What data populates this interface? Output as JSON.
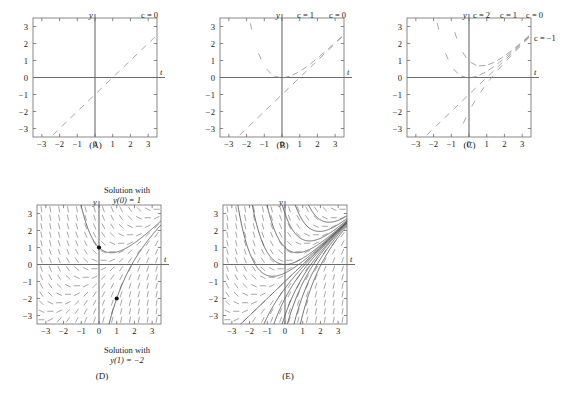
{
  "figure": {
    "axis_labels": {
      "x": "t",
      "y": "y"
    },
    "tick_labels_x": [
      "−3",
      "−2",
      "−1",
      "0",
      "1",
      "2",
      "3"
    ],
    "tick_labels_y": [
      "3",
      "2",
      "1",
      "0",
      "−1",
      "−2",
      "−3"
    ],
    "tick_values": [
      -3,
      -2,
      -1,
      0,
      1,
      2,
      3
    ],
    "axis_range": {
      "xmin": -3.5,
      "xmax": 3.5,
      "ymin": -3.5,
      "ymax": 3.5
    },
    "grid": false,
    "colors": {
      "axis": "#6b6b6b",
      "frame": "#6b6b6b",
      "dash": "#8a8a8a",
      "curve": "#5a5a5a",
      "point": "#111111",
      "text": "#1a1a1a"
    }
  },
  "panels": [
    {
      "id": "A",
      "caption": "(A)",
      "curve_labels_top": [
        {
          "text": "c = 0",
          "x_frac": 0.93
        }
      ],
      "curve_labels_right": [],
      "description": "slope field segments only along the line y = t (c = 0)"
    },
    {
      "id": "B",
      "caption": "(B)",
      "curve_labels_top": [
        {
          "text": "c = 1",
          "x_frac": 0.7
        },
        {
          "text": "c = 0",
          "x_frac": 0.95
        }
      ],
      "curve_labels_right": [],
      "description": "slope field segments along c = 0 and c = 1 solution curves"
    },
    {
      "id": "C",
      "caption": "(C)",
      "curve_labels_top": [
        {
          "text": "c = 2",
          "x_frac": 0.42
        },
        {
          "text": "c = 1",
          "x_frac": 0.7
        },
        {
          "text": "c = 0",
          "x_frac": 0.95
        }
      ],
      "curve_labels_right": [
        {
          "text": "c = −1",
          "y_frac": 0.2
        }
      ],
      "description": "slope field segments along c = 2, 1, 0 and −1 solution curves"
    },
    {
      "id": "D",
      "caption": "(D)",
      "curve_labels_top": [],
      "curve_labels_right": [],
      "annotations": [
        {
          "name": "solution-label-top",
          "line1": "Solution with",
          "line2": "y(0) = 1"
        },
        {
          "name": "solution-label-bottom",
          "line1": "Solution with",
          "line2": "y(1) = −2"
        }
      ],
      "marked_points": [
        {
          "t": 0,
          "y": 1
        },
        {
          "t": 1,
          "y": -2
        }
      ],
      "description": "full slope field with two highlighted solution curves through (0,1) and (1,−2)"
    },
    {
      "id": "E",
      "caption": "(E)",
      "curve_labels_top": [],
      "curve_labels_right": [],
      "description": "full slope field with a family of solution curves"
    }
  ],
  "chart_data": {
    "type": "line",
    "title": "",
    "xlabel": "t",
    "ylabel": "y",
    "xlim": [
      -3.5,
      3.5
    ],
    "ylim": [
      -3.5,
      3.5
    ],
    "grid": false,
    "legend": [
      "c = 2",
      "c = 1",
      "c = 0",
      "c = −1"
    ],
    "equation_family": "y = t − 1 + c e^(−t)",
    "slope_field": "dy/dt = t − y",
    "series": [
      {
        "name": "c = 0",
        "c": 0,
        "panels": [
          "A",
          "B",
          "C",
          "D",
          "E"
        ]
      },
      {
        "name": "c = 1",
        "c": 1,
        "panels": [
          "B",
          "C",
          "E"
        ]
      },
      {
        "name": "c = 2",
        "c": 2,
        "panels": [
          "C",
          "E"
        ]
      },
      {
        "name": "c = −1",
        "c": -1,
        "panels": [
          "C",
          "E"
        ]
      }
    ],
    "highlighted_solutions": [
      {
        "name": "y(0) = 1",
        "c": 2,
        "point": [
          0,
          1
        ]
      },
      {
        "name": "y(1) = −2",
        "c": -2.718,
        "point": [
          1,
          -2
        ]
      }
    ],
    "x": [
      -3,
      -2,
      -1,
      0,
      1,
      2,
      3
    ],
    "values": [
      -4,
      -3,
      -2,
      -1,
      0,
      1,
      2
    ]
  }
}
